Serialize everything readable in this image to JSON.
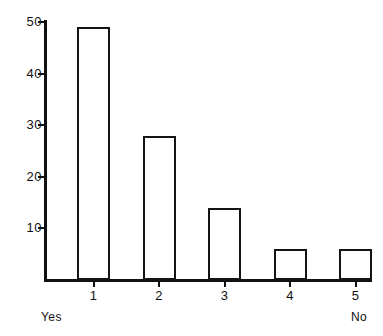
{
  "chart_data": {
    "type": "bar",
    "title": "",
    "subtitle": "",
    "xlabel": "",
    "ylabel": "",
    "categories": [
      "1",
      "2",
      "3",
      "4",
      "5"
    ],
    "values": [
      49,
      28,
      14,
      6,
      6
    ],
    "series": [
      {
        "name": "Responses",
        "values": [
          49,
          28,
          14,
          6,
          6
        ]
      }
    ],
    "ylim": [
      0,
      50
    ],
    "xlim": [
      0.5,
      5.5
    ],
    "y_ticks": [
      10,
      20,
      30,
      40,
      50
    ],
    "y_tick_labels": [
      "10",
      "20",
      "30",
      "40",
      "50"
    ],
    "x_tick_labels": [
      "1",
      "2",
      "3",
      "4",
      "5"
    ],
    "grid": false,
    "legend": false,
    "legend_position": "none",
    "annotations": [
      {
        "text": "Yes",
        "position": "below-axis-left"
      },
      {
        "text": "No",
        "position": "below-axis-right"
      }
    ],
    "bar_style": {
      "fill": "#ffffff",
      "edge": "#141414",
      "edge_width_px": 2,
      "adjacent": true
    },
    "axis_color": "#111111"
  },
  "scale_endpoints": {
    "left": "Yes",
    "right": "No"
  }
}
